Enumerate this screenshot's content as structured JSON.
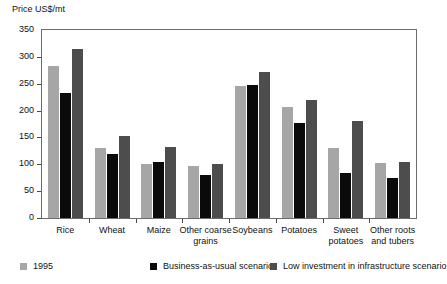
{
  "chart_data": {
    "type": "bar",
    "title": "",
    "ylabel": "Price US$/mt",
    "xlabel": "",
    "ylim": [
      0,
      350
    ],
    "yticks": [
      0,
      50,
      100,
      150,
      200,
      250,
      300,
      350
    ],
    "ytick_labels": [
      "0",
      "50",
      "100",
      "150",
      "200",
      "250",
      "300",
      "350"
    ],
    "grid": false,
    "legend_position": "bottom",
    "categories": [
      "Rice",
      "Wheat",
      "Maize",
      "Other coarse grains",
      "Soybeans",
      "Potatoes",
      "Sweet potatoes",
      "Other roots and tubers"
    ],
    "category_lines": [
      [
        "Rice"
      ],
      [
        "Wheat"
      ],
      [
        "Maize"
      ],
      [
        "Other coarse",
        "grains"
      ],
      [
        "Soybeans"
      ],
      [
        "Potatoes"
      ],
      [
        "Sweet",
        "potatoes"
      ],
      [
        "Other roots",
        "and tubers"
      ]
    ],
    "series": [
      {
        "name": "1995",
        "color": "#a6a6a6",
        "values": [
          283,
          130,
          100,
          96,
          245,
          206,
          130,
          102
        ]
      },
      {
        "name": "Business-as-usual scenario",
        "color": "#0a0a0a",
        "values": [
          233,
          120,
          104,
          81,
          248,
          177,
          84,
          74
        ]
      },
      {
        "name": "Low investment in infrastructure scenario",
        "color": "#4d4d4d",
        "values": [
          315,
          153,
          133,
          101,
          272,
          219,
          180,
          105
        ]
      }
    ]
  },
  "axis": {
    "y_title": "Price US$/mt"
  },
  "legend": {
    "items": [
      {
        "label": "1995",
        "color": "#a6a6a6"
      },
      {
        "label": "Business-as-usual scenario",
        "color": "#0a0a0a"
      },
      {
        "label": "Low investment in infrastructure scenario",
        "color": "#4d4d4d"
      }
    ]
  }
}
